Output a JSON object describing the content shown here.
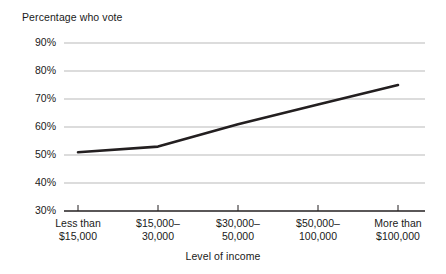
{
  "chart_data": {
    "type": "line",
    "title": "Percentage who vote",
    "xlabel": "Level of income",
    "ylabel": "Percentage who vote",
    "categories": [
      "Less than\n$15,000",
      "$15,000–\n30,000",
      "$30,000–\n50,000",
      "$50,000–\n100,000",
      "More than\n$100,000"
    ],
    "values": [
      51,
      53,
      61,
      68,
      75
    ],
    "ytick_labels": [
      "90%",
      "80%",
      "70%",
      "60%",
      "50%",
      "40%",
      "30%"
    ],
    "ytick_values": [
      90,
      80,
      70,
      60,
      50,
      40,
      30
    ],
    "ylim": [
      30,
      90
    ],
    "grid": true,
    "legend": "none",
    "series": [
      {
        "name": "Percentage who vote",
        "values": [
          51,
          53,
          61,
          68,
          75
        ]
      }
    ]
  },
  "style": {
    "line_color": "#231f20",
    "grid_color": "#b9b9b9",
    "axis_color": "#231f20",
    "text_color": "#1a1a1a",
    "background": "#ffffff"
  },
  "geometry": {
    "x_ticks_px": [
      78,
      158,
      238,
      318,
      398
    ],
    "grid_left_px": 64,
    "grid_right_px": 425,
    "y_top_px": 43,
    "y_bottom_px": 211,
    "px_per_10pct": 28
  }
}
